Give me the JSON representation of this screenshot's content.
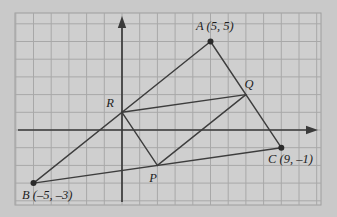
{
  "figure": {
    "background_color": "#c9c9c9",
    "plot_background_color": "#cfcfcf",
    "grid_color": "#a8a8a8",
    "axis_color": "#3a3a3a",
    "segment_color": "#3d3d3d",
    "point_color": "#2b2b2b",
    "label_color": "#1d1d1d",
    "frame": {
      "x": 15,
      "y": 13,
      "width": 306,
      "height": 192
    },
    "grid": {
      "unit_px": 17.7,
      "origin_px": {
        "x": 122,
        "y": 130
      },
      "x_min": -6,
      "x_max": 11,
      "y_min": -4,
      "y_max": 7,
      "visible": true
    },
    "axes": {
      "x_axis": {
        "label": "",
        "arrow": "right",
        "tick_labels": []
      },
      "y_axis": {
        "label": "",
        "arrow": "up",
        "tick_labels": []
      }
    },
    "points": [
      {
        "id": "A",
        "label": "A (5, 5)",
        "name": "A",
        "x": 5,
        "y": 5,
        "dot": true,
        "label_px": {
          "x": 196,
          "y": 30
        },
        "label_anchor": "start"
      },
      {
        "id": "B",
        "label": "B (–5, –3)",
        "name": "B",
        "x": -5,
        "y": -3,
        "dot": true,
        "label_px": {
          "x": 22,
          "y": 199
        },
        "label_anchor": "start"
      },
      {
        "id": "C",
        "label": "C (9, –1)",
        "name": "C",
        "x": 9,
        "y": -1,
        "dot": true,
        "label_px": {
          "x": 268,
          "y": 163
        },
        "label_anchor": "start"
      },
      {
        "id": "P",
        "label": "P",
        "name": "P",
        "x": 2,
        "y": -2,
        "dot": false,
        "label_px": {
          "x": 153,
          "y": 182
        },
        "label_anchor": "middle"
      },
      {
        "id": "Q",
        "label": "Q",
        "name": "Q",
        "x": 7,
        "y": 2,
        "dot": false,
        "label_px": {
          "x": 249,
          "y": 88
        },
        "label_anchor": "middle"
      },
      {
        "id": "R",
        "label": "R",
        "name": "R",
        "x": 0,
        "y": 1,
        "dot": false,
        "label_px": {
          "x": 110,
          "y": 107
        },
        "label_anchor": "middle"
      }
    ],
    "segments": [
      {
        "name": "segment-AB",
        "from": "A",
        "to": "B"
      },
      {
        "name": "segment-AC",
        "from": "A",
        "to": "C"
      },
      {
        "name": "segment-BC",
        "from": "B",
        "to": "C"
      },
      {
        "name": "segment-PQ",
        "from": "P",
        "to": "Q"
      },
      {
        "name": "segment-QR",
        "from": "Q",
        "to": "R"
      },
      {
        "name": "segment-RP",
        "from": "R",
        "to": "P"
      }
    ]
  },
  "chart_data": {
    "type": "scatter",
    "title": "",
    "xlabel": "",
    "ylabel": "",
    "xlim": [
      -6,
      11
    ],
    "ylim": [
      -4,
      7
    ],
    "grid": true,
    "legend": "none",
    "points": [
      {
        "label": "A (5, 5)",
        "x": 5,
        "y": 5
      },
      {
        "label": "B (–5, –3)",
        "x": -5,
        "y": -3
      },
      {
        "label": "C (9, –1)",
        "x": 9,
        "y": -1
      },
      {
        "label": "P",
        "x": 2,
        "y": -2
      },
      {
        "label": "Q",
        "x": 7,
        "y": 2
      },
      {
        "label": "R",
        "x": 0,
        "y": 1
      }
    ],
    "series": [
      {
        "name": "triangle-ABC",
        "vertices": [
          "A",
          "B",
          "C"
        ]
      },
      {
        "name": "triangle-PQR",
        "vertices": [
          "P",
          "Q",
          "R"
        ]
      }
    ]
  }
}
